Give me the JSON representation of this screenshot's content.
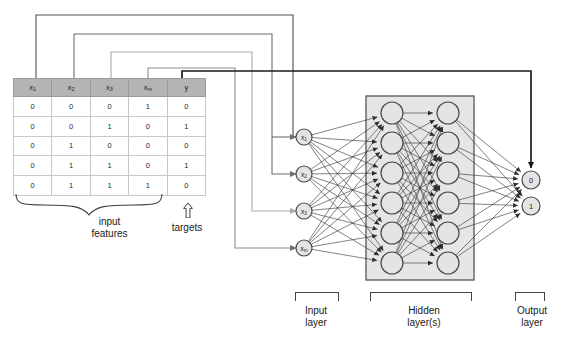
{
  "diagram": {
    "colors": {
      "header_fill": "#b4b4b4",
      "grid_line": "#c8c8c8",
      "hidden_box_fill": "#e6e6e6",
      "node_fill": "#e4e4e4",
      "node_stroke": "#4a4a4a",
      "wire_dark": "#1a1a1a",
      "wire_mid": "#6d6d6d",
      "wire_light": "#a9a9a9",
      "edge": "#2e2e2e"
    }
  },
  "dataset": {
    "columns": [
      {
        "key": "x1",
        "base": "x",
        "sub": "1"
      },
      {
        "key": "x2",
        "base": "x",
        "sub": "2"
      },
      {
        "key": "x3",
        "base": "x",
        "sub": "3"
      },
      {
        "key": "xm",
        "base": "x",
        "sub": "m"
      },
      {
        "key": "y",
        "base": "y",
        "sub": ""
      }
    ],
    "rows": [
      [
        "0",
        "0",
        "0",
        "1",
        "0"
      ],
      [
        "0",
        "0",
        "1",
        "0",
        "1"
      ],
      [
        "0",
        "1",
        "0",
        "0",
        "0"
      ],
      [
        "0",
        "1",
        "1",
        "0",
        "1"
      ],
      [
        "0",
        "1",
        "1",
        "1",
        "0"
      ]
    ]
  },
  "captions": {
    "input_features_line1": "input",
    "input_features_line2": "features",
    "targets": "targets",
    "input_layer_line1": "Input",
    "input_layer_line2": "layer",
    "hidden_layer_line1": "Hidden",
    "hidden_layer_line2": "layer(s)",
    "output_layer_line1": "Output",
    "output_layer_line2": "layer"
  },
  "network": {
    "input_nodes": [
      {
        "base": "x",
        "sub": "1"
      },
      {
        "base": "x",
        "sub": "2"
      },
      {
        "base": "x",
        "sub": "3"
      },
      {
        "base": "x",
        "sub": "m"
      }
    ],
    "hidden_layers": [
      {
        "node_count": 6
      },
      {
        "node_count": 6
      }
    ],
    "output_nodes": [
      {
        "label": "0"
      },
      {
        "label": "1"
      }
    ]
  }
}
